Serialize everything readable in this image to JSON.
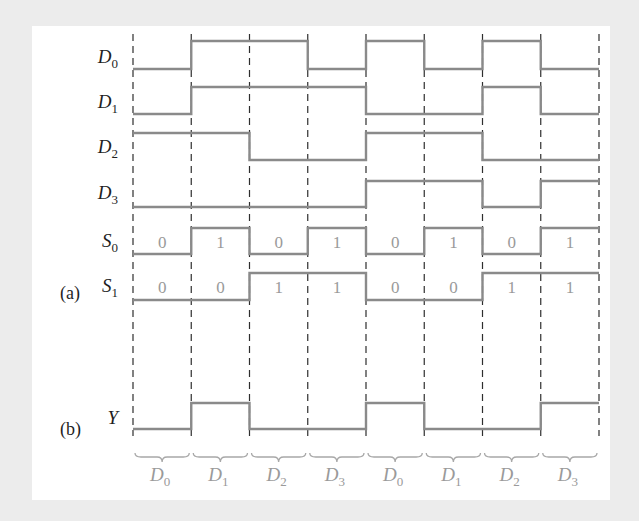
{
  "figure": {
    "part_labels": {
      "a": "(a)",
      "b": "(b)"
    },
    "time_slots": 8,
    "inputs": [
      {
        "name": "D",
        "sub": "0",
        "levels": [
          0,
          1,
          1,
          0,
          1,
          0,
          1,
          0
        ]
      },
      {
        "name": "D",
        "sub": "1",
        "levels": [
          0,
          1,
          1,
          1,
          0,
          0,
          1,
          0
        ]
      },
      {
        "name": "D",
        "sub": "2",
        "levels": [
          1,
          1,
          0,
          0,
          1,
          1,
          0,
          0
        ]
      },
      {
        "name": "D",
        "sub": "3",
        "levels": [
          0,
          0,
          0,
          0,
          1,
          1,
          0,
          1
        ]
      }
    ],
    "selects": [
      {
        "name": "S",
        "sub": "0",
        "levels": [
          0,
          1,
          0,
          1,
          0,
          1,
          0,
          1
        ],
        "values": [
          "0",
          "1",
          "0",
          "1",
          "0",
          "1",
          "0",
          "1"
        ]
      },
      {
        "name": "S",
        "sub": "1",
        "levels": [
          0,
          0,
          1,
          1,
          0,
          0,
          1,
          1
        ],
        "values": [
          "0",
          "0",
          "1",
          "1",
          "0",
          "0",
          "1",
          "1"
        ]
      }
    ],
    "output": {
      "name": "Y",
      "levels": [
        0,
        1,
        0,
        0,
        1,
        0,
        0,
        1
      ]
    },
    "selected_inputs": [
      {
        "name": "D",
        "sub": "0"
      },
      {
        "name": "D",
        "sub": "1"
      },
      {
        "name": "D",
        "sub": "2"
      },
      {
        "name": "D",
        "sub": "3"
      },
      {
        "name": "D",
        "sub": "0"
      },
      {
        "name": "D",
        "sub": "1"
      },
      {
        "name": "D",
        "sub": "2"
      },
      {
        "name": "D",
        "sub": "3"
      }
    ],
    "colors": {
      "wave": "#8a8a8a",
      "grid": "#2e2e2e",
      "label": "#1f1f1f",
      "value_text": "#9a9a9a",
      "panel": "#ffffff",
      "background": "#ececec"
    }
  }
}
